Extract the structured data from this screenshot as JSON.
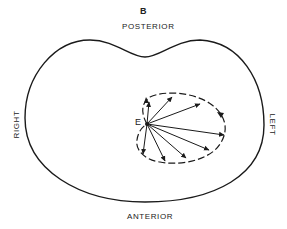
{
  "figure": {
    "panel_label": "B",
    "orientation_labels": {
      "top": "POSTERIOR",
      "bottom": "ANTERIOR",
      "left_side": "RIGHT",
      "right_side": "LEFT"
    },
    "origin_label": "E",
    "colors": {
      "line": "#1a1a1a",
      "background": "#ffffff"
    }
  }
}
